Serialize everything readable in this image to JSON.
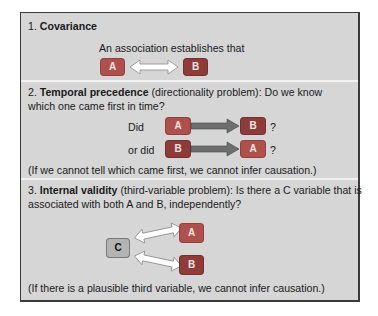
{
  "colors": {
    "panel_bg": "#d6d6d6",
    "separator": "#f2f2f2",
    "box_a": "#b0504c",
    "box_b": "#8e3b39",
    "box_c": "#b3b3b3",
    "arrow_gray": "#6e6e6e"
  },
  "sections": [
    {
      "number": "1.",
      "title": "Covariance",
      "rest": "",
      "statement": "An association establishes that",
      "diagram": {
        "left": "A",
        "right": "B",
        "arrow": "double-headed-outline"
      }
    },
    {
      "number": "2.",
      "title": "Temporal precedence",
      "rest_line1": " (directionality problem): Do we know",
      "rest_line2": "which one came first in time?",
      "rows": [
        {
          "lead": "Did",
          "from": "A",
          "to": "B",
          "suffix": "?"
        },
        {
          "lead": "or did",
          "from": "B",
          "to": "A",
          "suffix": "?"
        }
      ],
      "note": "(If we cannot tell which came first, we cannot infer causation.)"
    },
    {
      "number": "3.",
      "title": "Internal validity",
      "rest_line1": " (third-variable problem): Is there a C variable that is",
      "rest_line2": "associated with both A and B, independently?",
      "diagram": {
        "source": "C",
        "targets": [
          "A",
          "B"
        ],
        "arrow": "double-headed-outline"
      },
      "note": "(If there is a plausible third variable, we cannot infer causation.)"
    }
  ]
}
